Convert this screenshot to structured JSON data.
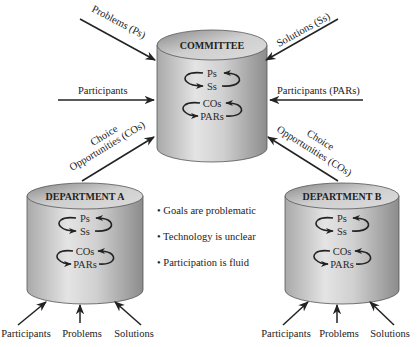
{
  "diagram": {
    "committee": {
      "title": "COMMITTEE",
      "inner": [
        "Ps",
        "Ss",
        "COs",
        "PARs"
      ]
    },
    "department_a": {
      "title": "DEPARTMENT A",
      "inner": [
        "Ps",
        "Ss",
        "COs",
        "PARs"
      ],
      "inputs": [
        "Participants",
        "Problems",
        "Solutions"
      ]
    },
    "department_b": {
      "title": "DEPARTMENT B",
      "inner": [
        "Ps",
        "Ss",
        "COs",
        "PARs"
      ],
      "inputs": [
        "Participants",
        "Problems",
        "Solutions"
      ]
    },
    "committee_inputs": {
      "top_left": "Problems (Ps)",
      "top_right": "Solutions (Ss)",
      "left": "Participants",
      "right": "Participants (PARs)",
      "bottom_left_line1": "Choice",
      "bottom_left_line2": "Opportunities (COs)",
      "bottom_right_line1": "Choice",
      "bottom_right_line2": "Opportunities (COs)"
    },
    "bullets": [
      "• Goals are problematic",
      "• Technology is unclear",
      "• Participation is fluid"
    ],
    "colors": {
      "cylinder_body_light": "#e2e2e2",
      "cylinder_body_dark": "#8f8f8f",
      "cylinder_top_light": "#d6d6d6",
      "cylinder_top_dark": "#8a8a8a",
      "stroke": "#2b2b2b"
    }
  }
}
